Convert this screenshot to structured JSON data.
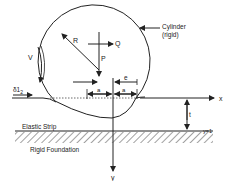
{
  "diagram": {
    "labels": {
      "cylinder": "Cylinder",
      "cylinder_note": "(rigid)",
      "radius": "R",
      "horizontal_force": "Q",
      "vertical_force": "P",
      "velocity": "V",
      "strain": "δ1",
      "strain_sub": "2",
      "eccentricity": "e",
      "half_contact_left": "a",
      "half_contact_right": "a",
      "x_axis": "x",
      "y_axis": "y",
      "thickness": "t",
      "boundary": "y=1",
      "elastic_strip": "Elastic Strip",
      "foundation": "Rigid Foundation"
    },
    "colors": {
      "line": "#222222",
      "background": "#ffffff"
    }
  }
}
